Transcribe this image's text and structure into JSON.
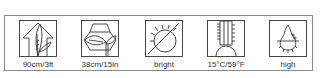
{
  "care_icons": [
    {
      "id": "height",
      "icon": "plant-height-icon",
      "label": "90cm/3ft"
    },
    {
      "id": "spread",
      "icon": "plant-spread-icon",
      "label": "38cm/15in"
    },
    {
      "id": "light",
      "icon": "sun-exposure-icon",
      "label": "bright"
    },
    {
      "id": "temperature",
      "icon": "thermometer-icon",
      "label": "15°C/59°F"
    },
    {
      "id": "humidity",
      "icon": "water-drop-icon",
      "label": "high"
    }
  ],
  "colors": {
    "line": "#333333",
    "frame": "#8a8a8a",
    "text": "#333333"
  }
}
